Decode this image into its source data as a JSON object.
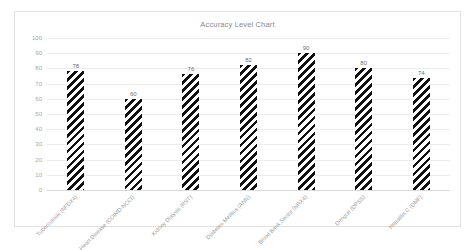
{
  "chart_data": {
    "type": "bar",
    "title": "Accuracy Level Chart",
    "xlabel": "",
    "ylabel": "",
    "ylim": [
      0,
      100
    ],
    "ytick_step": 10,
    "yticks": [
      "100",
      "90",
      "80",
      "70",
      "60",
      "50",
      "40",
      "30",
      "20",
      "10",
      "0"
    ],
    "grid": true,
    "legend": false,
    "bar_fill": "diagonal-hatch-black-on-white",
    "categories": [
      "Tuberculosis (NFDX4)",
      "Heart Disease (COIMD-NCCI)",
      "Kidney Dialysis (RST)",
      "Diabetes Mellitus (ANN)",
      "Blood Bank Sector (NRX4)",
      "Dengue (DPSS)",
      "Hepatitis C (DMF)"
    ],
    "values": [
      78,
      60,
      76,
      82,
      90,
      80,
      74
    ],
    "data_labels": [
      "78",
      "60",
      "76",
      "82",
      "90",
      "80",
      "74"
    ]
  },
  "colors": {
    "frame_border": "#e2e2e2",
    "gridline": "#ececec",
    "axis_base": "#d9d9d9",
    "title_text": "#8a8a8a",
    "tick_text": "#a6a6a6",
    "category_text": "#9a9a9a",
    "value_text": "#6f6f6f",
    "bar_hatch": "#111111",
    "bar_background": "#ffffff",
    "plot_background": "#ffffff"
  }
}
